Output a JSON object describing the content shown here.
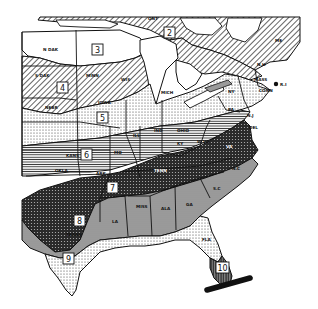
{
  "map": {
    "type": "zone-map",
    "region": "Eastern and Central United States",
    "style": "black-and-white hatched pattern map",
    "zones": [
      {
        "id": "2",
        "label": "2",
        "pattern": "diagonal-hatch",
        "x": 170,
        "y": 33
      },
      {
        "id": "3",
        "label": "3",
        "pattern": "blank",
        "x": 98,
        "y": 50
      },
      {
        "id": "4",
        "label": "4",
        "pattern": "diagonal-hatch",
        "x": 63,
        "y": 88
      },
      {
        "id": "5",
        "label": "5",
        "pattern": "light-dots",
        "x": 103,
        "y": 118
      },
      {
        "id": "6",
        "label": "6",
        "pattern": "horizontal-lines",
        "x": 87,
        "y": 155
      },
      {
        "id": "7",
        "label": "7",
        "pattern": "dark-crosshatch",
        "x": 113,
        "y": 188
      },
      {
        "id": "8",
        "label": "8",
        "pattern": "gray-stipple",
        "x": 80,
        "y": 221
      },
      {
        "id": "9",
        "label": "9",
        "pattern": "light-dots",
        "x": 69,
        "y": 259
      },
      {
        "id": "10",
        "label": "10",
        "pattern": "vertical-lines",
        "x": 223,
        "y": 268
      }
    ],
    "state_labels": [
      {
        "name": "N DAK",
        "x": 43,
        "y": 51
      },
      {
        "name": "S DAK",
        "x": 35,
        "y": 77
      },
      {
        "name": "MINN",
        "x": 86,
        "y": 77
      },
      {
        "name": "WIS",
        "x": 121,
        "y": 81
      },
      {
        "name": "MICH",
        "x": 161,
        "y": 94
      },
      {
        "name": "IOWA",
        "x": 98,
        "y": 104
      },
      {
        "name": "NEBR",
        "x": 45,
        "y": 109
      },
      {
        "name": "ILL",
        "x": 133,
        "y": 137
      },
      {
        "name": "IND",
        "x": 154,
        "y": 132
      },
      {
        "name": "OHIO",
        "x": 177,
        "y": 132
      },
      {
        "name": "KANS",
        "x": 66,
        "y": 157
      },
      {
        "name": "MO",
        "x": 114,
        "y": 154
      },
      {
        "name": "OKLA",
        "x": 55,
        "y": 172
      },
      {
        "name": "ARK",
        "x": 96,
        "y": 175
      },
      {
        "name": "KY",
        "x": 177,
        "y": 145
      },
      {
        "name": "W VA",
        "x": 197,
        "y": 143
      },
      {
        "name": "TENN",
        "x": 154,
        "y": 172
      },
      {
        "name": "VA",
        "x": 226,
        "y": 148
      },
      {
        "name": "PA",
        "x": 228,
        "y": 111
      },
      {
        "name": "NY",
        "x": 228,
        "y": 93
      },
      {
        "name": "N.J",
        "x": 247,
        "y": 117
      },
      {
        "name": "DEL",
        "x": 249,
        "y": 129
      },
      {
        "name": "CONN",
        "x": 259,
        "y": 92
      },
      {
        "name": "MASS",
        "x": 254,
        "y": 81
      },
      {
        "name": "R.I",
        "x": 280,
        "y": 84
      },
      {
        "name": "N.H",
        "x": 257,
        "y": 66
      },
      {
        "name": "ME",
        "x": 275,
        "y": 42
      },
      {
        "name": "ONT",
        "x": 148,
        "y": 20
      },
      {
        "name": "N.C",
        "x": 232,
        "y": 170
      },
      {
        "name": "S.C",
        "x": 213,
        "y": 190
      },
      {
        "name": "GA",
        "x": 186,
        "y": 206
      },
      {
        "name": "ALA",
        "x": 161,
        "y": 210
      },
      {
        "name": "MISS",
        "x": 136,
        "y": 208
      },
      {
        "name": "LA",
        "x": 112,
        "y": 223
      },
      {
        "name": "TEXAS",
        "x": 66,
        "y": 236
      },
      {
        "name": "FLA",
        "x": 202,
        "y": 241
      }
    ],
    "colors": {
      "background": "#ffffff",
      "ink": "#111111",
      "gray_fill": "#9a9a9a",
      "dark_fill": "#3a3a3a"
    }
  }
}
